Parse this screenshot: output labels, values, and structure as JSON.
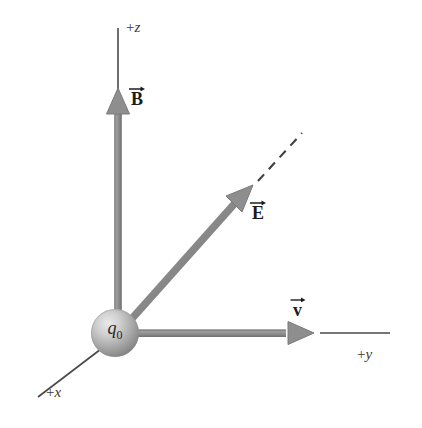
{
  "figure": {
    "background_color": "#ffffff",
    "axis_line_color": "#4a4a4a",
    "vector_color": "#8c8c8c",
    "vector_edge_color": "#6e6e6e",
    "dashed_line_color": "#3f3f3f",
    "label_color": "#3b3b3b",
    "vector_label_color": "#1c1c1c"
  },
  "axes": [
    {
      "id": "z-axis",
      "label_sign": "+",
      "label_var": "z",
      "label": "+z",
      "direction": "up",
      "from": [
        118,
        330
      ],
      "to": [
        118,
        28
      ]
    },
    {
      "id": "y-axis",
      "label_sign": "+",
      "label_var": "y",
      "label": "+y",
      "direction": "right",
      "from": [
        118,
        333
      ],
      "to": [
        390,
        333
      ]
    },
    {
      "id": "x-axis",
      "label_sign": "+",
      "label_var": "x",
      "label": "+x",
      "direction": "down-left",
      "from": [
        110,
        340
      ],
      "to": [
        38,
        396
      ]
    }
  ],
  "charge": {
    "name": "point-charge",
    "label_var": "q",
    "label_sub": "0",
    "label": "q0",
    "center": [
      115,
      333
    ],
    "radius": 24,
    "highlight_color": "#e2e2e2",
    "mid_color": "#b4b4b4",
    "shadow_color": "#7d7d7d"
  },
  "vectors": [
    {
      "id": "B-vector",
      "symbol": "B",
      "label": "B",
      "description": "magnetic field along +z",
      "from": [
        118,
        330
      ],
      "to": [
        118,
        95
      ],
      "has_overarrow": true
    },
    {
      "id": "E-vector",
      "symbol": "E",
      "label": "E",
      "description": "electric field in the y-z plane at 45 degrees",
      "from": [
        128,
        322
      ],
      "to": [
        252,
        186
      ],
      "has_overarrow": true,
      "dashed_extension": {
        "from": [
          256,
          183
        ],
        "to": [
          302,
          133
        ]
      }
    },
    {
      "id": "v-vector",
      "symbol": "v",
      "label": "v",
      "description": "velocity along +y",
      "from": [
        134,
        333
      ],
      "to": [
        313,
        333
      ],
      "has_overarrow": true
    }
  ]
}
